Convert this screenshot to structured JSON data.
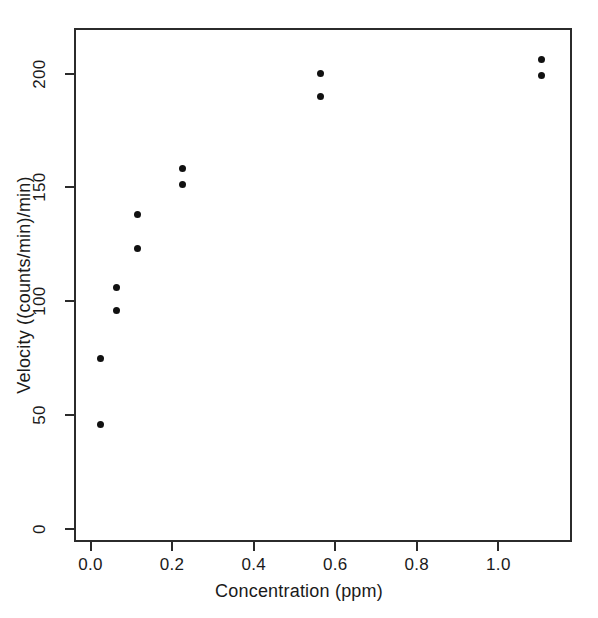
{
  "chart_data": {
    "type": "scatter",
    "title": "",
    "xlabel": "Concentration (ppm)",
    "ylabel": "Velocity ((counts/min)/min)",
    "xlim": [
      -0.0405,
      1.1805
    ],
    "ylim": [
      -5.6,
      220.0
    ],
    "xticks": [
      0.0,
      0.2,
      0.4,
      0.6,
      0.8,
      1.0
    ],
    "xticklabels": [
      "0.0",
      "0.2",
      "0.4",
      "0.6",
      "0.8",
      "1.0"
    ],
    "yticks": [
      0,
      50,
      100,
      150,
      200
    ],
    "yticklabels": [
      "0",
      "50",
      "100",
      "150",
      "200"
    ],
    "grid": false,
    "legend": null,
    "marker": "filled-circle",
    "marker_color": "#111111",
    "box_color": "#2b2b2b",
    "background": "#ffffff",
    "x": [
      0.02,
      0.02,
      0.06,
      0.06,
      0.11,
      0.11,
      0.22,
      0.22,
      0.56,
      0.56,
      1.1,
      1.1
    ],
    "y": [
      76,
      47,
      107,
      97,
      139,
      124,
      159,
      152,
      201,
      191,
      207,
      200
    ],
    "points": [
      {
        "x": 0.02,
        "y": 76
      },
      {
        "x": 0.02,
        "y": 47
      },
      {
        "x": 0.06,
        "y": 107
      },
      {
        "x": 0.06,
        "y": 97
      },
      {
        "x": 0.11,
        "y": 139
      },
      {
        "x": 0.11,
        "y": 124
      },
      {
        "x": 0.22,
        "y": 159
      },
      {
        "x": 0.22,
        "y": 152
      },
      {
        "x": 0.56,
        "y": 201
      },
      {
        "x": 0.56,
        "y": 191
      },
      {
        "x": 1.1,
        "y": 207
      },
      {
        "x": 1.1,
        "y": 200
      }
    ]
  }
}
